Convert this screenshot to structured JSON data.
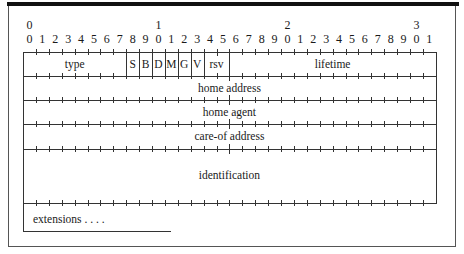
{
  "diagram": {
    "bit_ruler": {
      "tens": [
        "0",
        "1",
        "2",
        "3"
      ],
      "tens_positions": [
        0,
        10,
        20,
        30
      ],
      "units": [
        "0",
        "1",
        "2",
        "3",
        "4",
        "5",
        "6",
        "7",
        "8",
        "9",
        "0",
        "1",
        "2",
        "3",
        "4",
        "5",
        "6",
        "7",
        "8",
        "9",
        "0",
        "1",
        "2",
        "3",
        "4",
        "5",
        "6",
        "7",
        "8",
        "9",
        "0",
        "1"
      ]
    },
    "rows": [
      {
        "name": "row-1",
        "fields": [
          {
            "label": "type",
            "start_bit": 0,
            "end_bit": 8
          },
          {
            "label": "S",
            "start_bit": 8,
            "end_bit": 9
          },
          {
            "label": "B",
            "start_bit": 9,
            "end_bit": 10
          },
          {
            "label": "D",
            "start_bit": 10,
            "end_bit": 11
          },
          {
            "label": "M",
            "start_bit": 11,
            "end_bit": 12
          },
          {
            "label": "G",
            "start_bit": 12,
            "end_bit": 13
          },
          {
            "label": "V",
            "start_bit": 13,
            "end_bit": 14
          },
          {
            "label": "rsv",
            "start_bit": 14,
            "end_bit": 16
          },
          {
            "label": "lifetime",
            "start_bit": 16,
            "end_bit": 32
          }
        ]
      },
      {
        "name": "row-2",
        "fields": [
          {
            "label": "home address",
            "start_bit": 0,
            "end_bit": 32
          }
        ]
      },
      {
        "name": "row-3",
        "fields": [
          {
            "label": "home agent",
            "start_bit": 0,
            "end_bit": 32
          }
        ]
      },
      {
        "name": "row-4",
        "fields": [
          {
            "label": "care-of address",
            "start_bit": 0,
            "end_bit": 32
          }
        ]
      },
      {
        "name": "row-5",
        "fields": [
          {
            "label": "identification",
            "start_bit": 0,
            "end_bit": 32
          }
        ]
      },
      {
        "name": "row-6",
        "fields": [
          {
            "label": "extensions . . . .",
            "start_bit": 0,
            "end_bit": 11
          }
        ]
      }
    ]
  }
}
